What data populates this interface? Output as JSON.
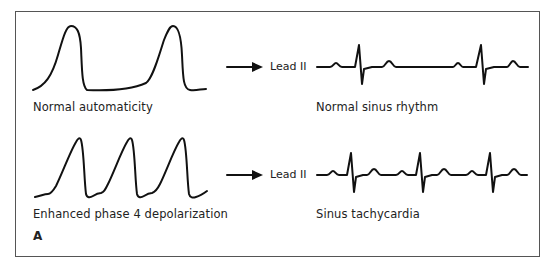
{
  "figure": {
    "panel_letter": "A",
    "rows": [
      {
        "action_potential_label": "Normal automaticity",
        "lead_label": "Lead II",
        "rhythm_label": "Normal sinus rhythm"
      },
      {
        "action_potential_label": "Enhanced phase 4 depolarization",
        "lead_label": "Lead II",
        "rhythm_label": "Sinus tachycardia"
      }
    ]
  }
}
